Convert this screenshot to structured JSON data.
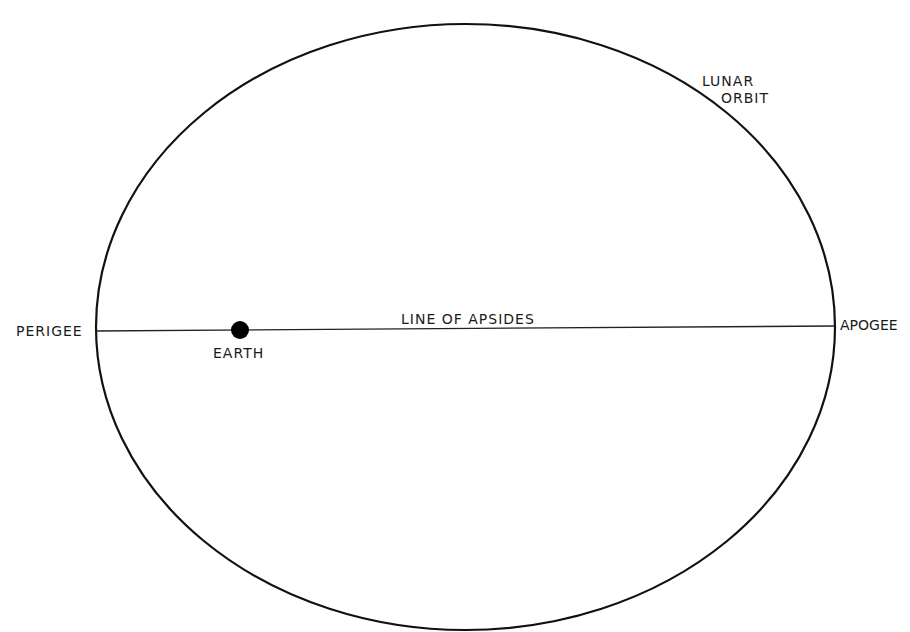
{
  "diagram": {
    "colors": {
      "stroke": "#111111",
      "background": "#ffffff",
      "earth": "#000000"
    },
    "labels": {
      "lunar_orbit_line1": "LUNAR",
      "lunar_orbit_line2": "ORBIT",
      "perigee": "PERIGEE",
      "apogee": "APOGEE",
      "line_of_apsides": "LINE OF APSIDES",
      "earth": "EARTH"
    },
    "shapes": {
      "orbit_ellipse": {
        "cx": 465.5,
        "cy": 327,
        "rx": 369.5,
        "ry": 303
      },
      "apsides_line": {
        "x1": 96,
        "y1": 331,
        "x2": 835,
        "y2": 326
      },
      "earth_dot": {
        "cx": 240,
        "cy": 330,
        "r": 9
      }
    }
  }
}
